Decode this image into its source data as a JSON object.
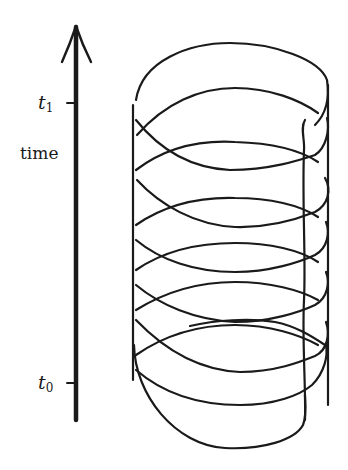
{
  "figure": {
    "axis": {
      "title": "time",
      "direction": "up",
      "ticks": [
        {
          "id": "t1",
          "base": "t",
          "sub": "1"
        },
        {
          "id": "t0",
          "base": "t",
          "sub": "0"
        }
      ]
    },
    "colors": {
      "ink": "#1a1a1a",
      "background": "#ffffff"
    }
  }
}
